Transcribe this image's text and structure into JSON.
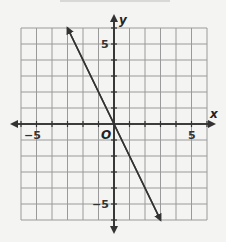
{
  "chart_data": {
    "type": "line",
    "title": "",
    "xlabel": "x",
    "ylabel": "y",
    "xlim": [
      -6,
      6
    ],
    "ylim": [
      -6,
      6
    ],
    "grid": true,
    "x_ticks_labeled": [
      -5,
      5
    ],
    "y_ticks_labeled": [
      5,
      -5
    ],
    "origin_label": "O",
    "series": [
      {
        "name": "line",
        "equation": "y = -2x",
        "x": [
          -3,
          0,
          3
        ],
        "y": [
          6,
          0,
          -6
        ],
        "arrows_both_ends": true
      }
    ]
  },
  "labels": {
    "x_axis": "x",
    "y_axis": "y",
    "origin": "O",
    "x_neg5": "−5",
    "x_pos5": "5",
    "y_pos5": "5",
    "y_neg5": "−5"
  },
  "colors": {
    "grid": "#9a9a9a",
    "axis": "#333333",
    "line": "#333333",
    "background": "#f4f4f2"
  }
}
